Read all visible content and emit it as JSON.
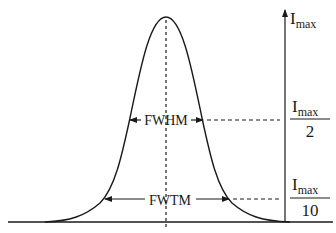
{
  "diagram": {
    "colors": {
      "stroke": "#1a1a1a",
      "background": "#ffffff"
    },
    "axis": {
      "top_label": {
        "main": "I",
        "sub": "max"
      }
    },
    "levels": [
      {
        "id": "half",
        "width_label": "FWHM",
        "numerator": {
          "main": "I",
          "sub": "max"
        },
        "denominator": "2"
      },
      {
        "id": "tenth",
        "width_label": "FWTM",
        "numerator": {
          "main": "I",
          "sub": "max"
        },
        "denominator": "10"
      }
    ]
  }
}
